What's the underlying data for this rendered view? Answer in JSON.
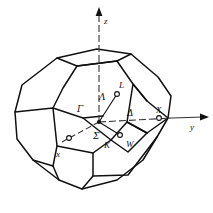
{
  "figure": {
    "background_color": "#ffffff",
    "line_color": "#111111"
  },
  "axes": {
    "x": {
      "label": "x",
      "arrow": false
    },
    "y": {
      "label": "y",
      "arrow": true
    },
    "z": {
      "label": "z",
      "arrow": true
    }
  },
  "symmetry_points": {
    "gamma": {
      "label": "Γ",
      "name": "zone-centre"
    },
    "L": {
      "label": "L",
      "name": "hexagon-face-centre"
    },
    "X": {
      "label": "X",
      "name": "square-face-centre"
    },
    "W": {
      "label": "W",
      "name": "corner-point"
    },
    "K": {
      "label": "K",
      "name": "edge-midpoint"
    }
  },
  "symmetry_lines": {
    "lambda": {
      "label": "Λ",
      "name": "gamma-to-L"
    },
    "delta": {
      "label": "Δ",
      "name": "gamma-to-X"
    },
    "sigma": {
      "label": "Σ",
      "name": "gamma-to-K"
    }
  }
}
